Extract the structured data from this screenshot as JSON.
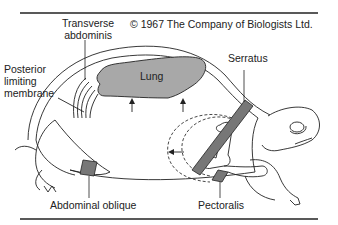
{
  "copyright": "© 1967 The Company of Biologists Ltd.",
  "labels": {
    "transverse_abdominis": [
      "Transverse",
      "abdominis"
    ],
    "posterior_limiting_membrane": [
      "Posterior",
      "limiting",
      "membrane"
    ],
    "serratus": "Serratus",
    "lung": "Lung",
    "abdominal_oblique": "Abdominal oblique",
    "pectoralis": "Pectoralis"
  },
  "colors": {
    "lung_fill": "#a8a8a8",
    "muscle_fill": "#777777",
    "line": "#222222"
  }
}
